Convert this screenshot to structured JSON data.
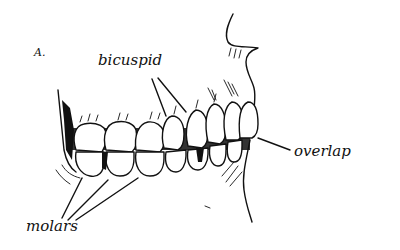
{
  "figure": {
    "label": "A.",
    "ink_color": "#111111",
    "background_color": "#ffffff"
  },
  "annotations": {
    "bicuspid": "bicuspid",
    "overlap": "overlap",
    "molars": "molars"
  },
  "teeth": {
    "upper": [
      "molar",
      "molar",
      "molar",
      "bicuspid",
      "bicuspid",
      "canine",
      "incisor",
      "incisor"
    ],
    "lower": [
      "molar",
      "molar",
      "molar",
      "bicuspid",
      "bicuspid",
      "canine",
      "incisor",
      "incisor"
    ]
  }
}
